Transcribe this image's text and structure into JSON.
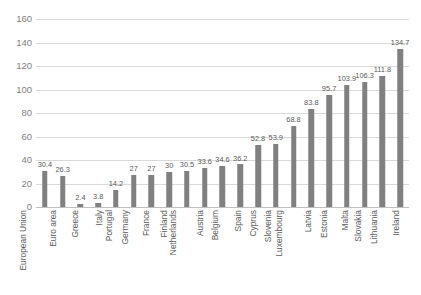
{
  "chart_data": {
    "type": "bar",
    "title": "",
    "subtitle": "",
    "xlabel": "",
    "ylabel": "",
    "ylim": [
      0,
      160
    ],
    "yticks": [
      0,
      20,
      40,
      60,
      80,
      100,
      120,
      140,
      160
    ],
    "grid": true,
    "legend": false,
    "legend_position": "none",
    "bar_color": "#808080",
    "gridline_color": "#d9d9d9",
    "label_color": "#595959",
    "categories": [
      "European Union",
      "Euro area",
      "Greece",
      "Italy",
      "Portugal",
      "Germany",
      "France",
      "Finland",
      "Netherlands",
      "Austria",
      "Belgium",
      "Spain",
      "Cyprus",
      "Slovenia",
      "Luxembourg",
      "Latvia",
      "Estonia",
      "Malta",
      "Slovakia",
      "Lithuania",
      "Ireland"
    ],
    "values": [
      30.4,
      26.3,
      2.4,
      3.8,
      14.2,
      27,
      27,
      30,
      30.5,
      33.6,
      34.6,
      36.2,
      52.8,
      53.9,
      68.8,
      83.8,
      95.7,
      103.9,
      106.3,
      111.8,
      134.7
    ],
    "value_labels": [
      "30.4",
      "26.3",
      "2.4",
      "3.8",
      "14.2",
      "27",
      "27",
      "30",
      "30.5",
      "33.6",
      "34.6",
      "36.2",
      "52.8",
      "53.9",
      "68.8",
      "83.8",
      "95.7",
      "103.9",
      "106.3",
      "111.8",
      "134.7"
    ],
    "ytick_labels": [
      "0",
      "20",
      "40",
      "60",
      "80",
      "100",
      "120",
      "140",
      "160"
    ]
  }
}
